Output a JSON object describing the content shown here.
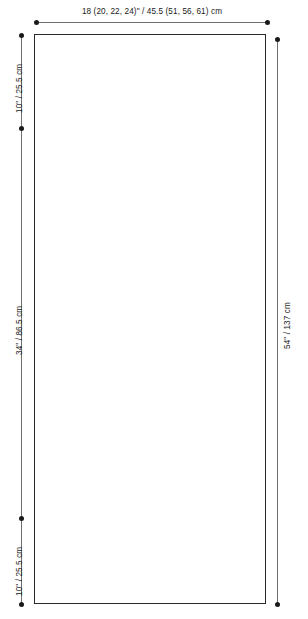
{
  "diagram": {
    "type": "garment-schematic",
    "shape": "rectangle",
    "top_dimension": {
      "label": "18 (20, 22, 24)\" / 45.5 (51, 56, 61) cm",
      "inches": "18 (20, 22, 24)\"",
      "centimeters": "45.5 (51, 56, 61) cm",
      "orientation": "horizontal",
      "position": "top"
    },
    "left_dimensions": [
      {
        "label": "10\" / 25.5 cm",
        "inches": "10\"",
        "centimeters": "25.5 cm",
        "orientation": "vertical",
        "position": "left-top"
      },
      {
        "label": "34\" / 86.5 cm",
        "inches": "34\"",
        "centimeters": "86.5 cm",
        "orientation": "vertical",
        "position": "left-middle"
      },
      {
        "label": "10\" / 25.5 cm",
        "inches": "10\"",
        "centimeters": "25.5 cm",
        "orientation": "vertical",
        "position": "left-bottom"
      }
    ],
    "right_dimension": {
      "label": "54\" / 137 cm",
      "inches": "54\"",
      "centimeters": "137 cm",
      "orientation": "vertical",
      "position": "right"
    },
    "colors": {
      "panel_outline": "#2b2b2b",
      "dimension_line": "#707070",
      "dimension_dot": "#1a1a1a",
      "label_text": "#1a1a1a",
      "background": "#ffffff"
    }
  }
}
